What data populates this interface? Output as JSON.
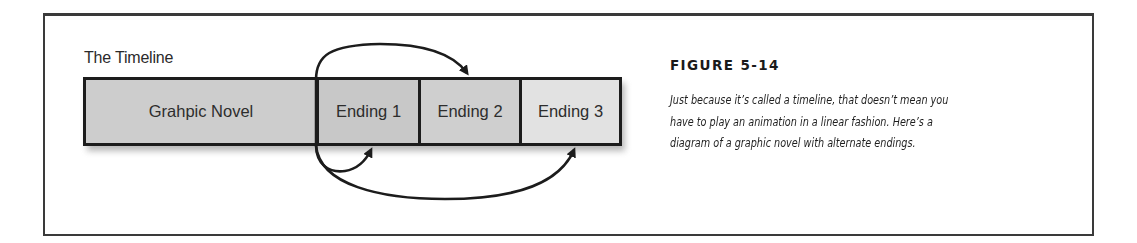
{
  "figure": {
    "title": "FIGURE 5-14",
    "caption_lines": [
      "Just because it’s called a timeline, that doesn’t mean you",
      "have to play an animation in a linear fashion. Here’s a",
      "diagram of a graphic novel with alternate endings."
    ]
  },
  "diagram": {
    "timeline_label": "The Timeline",
    "segments": [
      {
        "label": "Grahpic Novel",
        "shade": "#cdcdcd"
      },
      {
        "label": "Ending 1",
        "shade": "#c8c8c8"
      },
      {
        "label": "Ending 2",
        "shade": "#cfcfcf"
      },
      {
        "label": "Ending 3",
        "shade": "#e2e2e2"
      }
    ],
    "arrows": [
      {
        "from": "Grahpic Novel",
        "to": "Ending 1",
        "position": "below"
      },
      {
        "from": "Grahpic Novel",
        "to": "Ending 2",
        "position": "above"
      },
      {
        "from": "Grahpic Novel",
        "to": "Ending 3",
        "position": "below"
      }
    ],
    "colors": {
      "stroke": "#1c1c1c",
      "frame": "#3a3a3a"
    }
  }
}
